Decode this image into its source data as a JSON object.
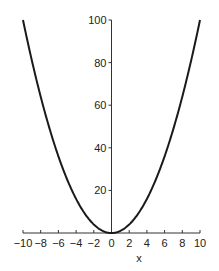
{
  "chart_data": {
    "type": "line",
    "title": "",
    "xlabel": "x",
    "ylabel": "",
    "xlim": [
      -10,
      10
    ],
    "ylim": [
      0,
      100
    ],
    "x_ticks": [
      "-10",
      "-8",
      "-6",
      "-4",
      "-2",
      "0",
      "2",
      "4",
      "6",
      "8",
      "10"
    ],
    "y_ticks": [
      "20",
      "40",
      "60",
      "80",
      "100"
    ],
    "grid": false,
    "legend": null,
    "series": [
      {
        "name": "y = x^2",
        "x": [
          -10,
          -8,
          -6,
          -4,
          -2,
          0,
          2,
          4,
          6,
          8,
          10
        ],
        "y": [
          100,
          64,
          36,
          16,
          4,
          0,
          4,
          16,
          36,
          64,
          100
        ]
      }
    ],
    "colors": {
      "curve": "#1a1a1a",
      "axis": "#333333"
    }
  }
}
